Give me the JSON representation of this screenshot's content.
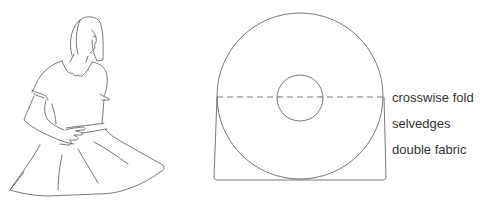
{
  "figure": {
    "stroke_color": "#555555"
  },
  "diagram": {
    "labels": {
      "crosswise_fold": "crosswise fold",
      "selvedges": "selvedges",
      "double_fabric": "double fabric"
    },
    "outer_circle": {
      "cx": 300,
      "cy": 96,
      "r": 83
    },
    "inner_circle": {
      "cx": 300,
      "cy": 98,
      "r": 23
    },
    "fold_line_y": 97,
    "line_color": "#555555"
  }
}
